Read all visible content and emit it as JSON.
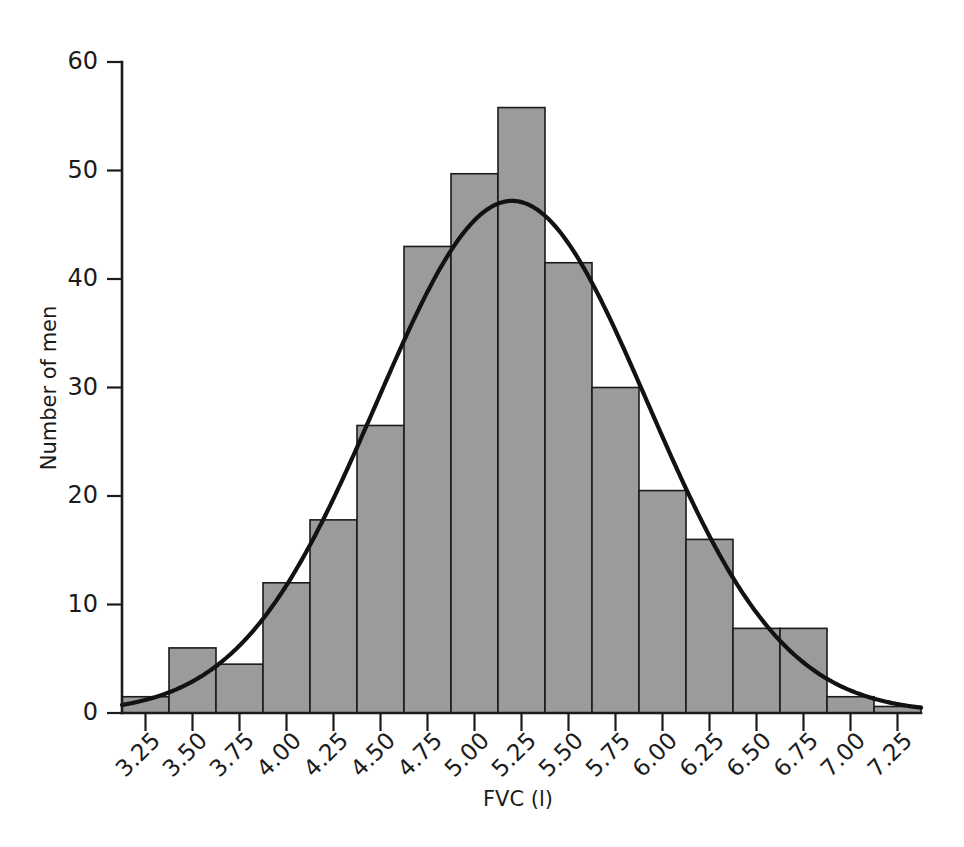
{
  "chart_data": {
    "type": "bar",
    "title": "",
    "subtitle": "",
    "xlabel": "FVC (l)",
    "ylabel": "Number of men",
    "categories": [
      "3.25",
      "3.50",
      "3.75",
      "4.00",
      "4.25",
      "4.50",
      "4.75",
      "5.00",
      "5.25",
      "5.50",
      "5.75",
      "6.00",
      "6.25",
      "6.50",
      "6.75",
      "7.00",
      "7.25"
    ],
    "values": [
      1.5,
      6.0,
      4.5,
      12.0,
      17.8,
      26.5,
      43.0,
      49.7,
      55.8,
      41.5,
      30.0,
      20.5,
      16.0,
      7.8,
      7.8,
      1.5,
      0.6
    ],
    "xlim": [
      3.125,
      7.375
    ],
    "ylim": [
      0,
      60
    ],
    "ytick_labels": [
      "0",
      "10",
      "20",
      "30",
      "40",
      "50",
      "60"
    ],
    "ytick_values": [
      0,
      10,
      20,
      30,
      40,
      50,
      60
    ],
    "xtick_labels": [
      "3.25",
      "3.50",
      "3.75",
      "4.00",
      "4.25",
      "4.50",
      "4.75",
      "5.00",
      "5.25",
      "5.50",
      "5.75",
      "6.00",
      "6.25",
      "6.50",
      "6.75",
      "7.00",
      "7.25"
    ],
    "bin_width": 0.25,
    "grid": false,
    "legend": null,
    "bar_fill_color": "#9b9b9b",
    "bar_edge_color": "#1b1b1b",
    "axis_color": "#1b1b1b",
    "background_color": "#ffffff",
    "overlay": {
      "type": "line",
      "name": "normal-curve",
      "color": "#121212",
      "peak_x": 5.2,
      "peak_y": 47.2,
      "mean": 5.2,
      "sd": 0.72,
      "amplitude": 47.2,
      "x_start": 3.125,
      "x_end": 7.375
    },
    "xtick_label_rotation": 45
  }
}
